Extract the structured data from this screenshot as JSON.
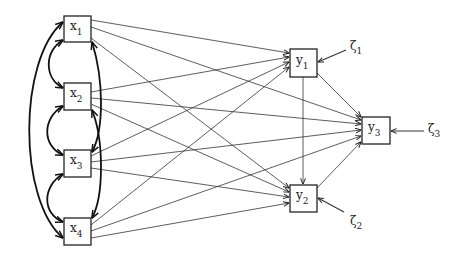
{
  "diagram": {
    "type": "path-diagram",
    "nodes": [
      {
        "id": "x1",
        "base": "x",
        "sub": "1",
        "role": "exogenous",
        "x": 64,
        "y": 16,
        "w": 27,
        "h": 26
      },
      {
        "id": "x2",
        "base": "x",
        "sub": "2",
        "role": "exogenous",
        "x": 64,
        "y": 83,
        "w": 27,
        "h": 27
      },
      {
        "id": "x3",
        "base": "x",
        "sub": "3",
        "role": "exogenous",
        "x": 64,
        "y": 150,
        "w": 27,
        "h": 27
      },
      {
        "id": "x4",
        "base": "x",
        "sub": "4",
        "role": "exogenous",
        "x": 64,
        "y": 218,
        "w": 27,
        "h": 27
      },
      {
        "id": "y1",
        "base": "y",
        "sub": "1",
        "role": "endogenous",
        "x": 290,
        "y": 49,
        "w": 27,
        "h": 28
      },
      {
        "id": "y2",
        "base": "y",
        "sub": "2",
        "role": "endogenous",
        "x": 290,
        "y": 185,
        "w": 27,
        "h": 27
      },
      {
        "id": "y3",
        "base": "y",
        "sub": "3",
        "role": "endogenous",
        "x": 362,
        "y": 117,
        "w": 28,
        "h": 27
      }
    ],
    "disturbances": [
      {
        "id": "zeta1",
        "base": "ζ",
        "sub": "1",
        "target": "y1"
      },
      {
        "id": "zeta2",
        "base": "ζ",
        "sub": "2",
        "target": "y2"
      },
      {
        "id": "zeta3",
        "base": "ζ",
        "sub": "3",
        "target": "y3"
      }
    ],
    "paths": [
      {
        "from": "x1",
        "to": "y1"
      },
      {
        "from": "x1",
        "to": "y3"
      },
      {
        "from": "x1",
        "to": "y2"
      },
      {
        "from": "x2",
        "to": "y1"
      },
      {
        "from": "x2",
        "to": "y3"
      },
      {
        "from": "x2",
        "to": "y2"
      },
      {
        "from": "x3",
        "to": "y1"
      },
      {
        "from": "x3",
        "to": "y3"
      },
      {
        "from": "x3",
        "to": "y2"
      },
      {
        "from": "x4",
        "to": "y1"
      },
      {
        "from": "x4",
        "to": "y3"
      },
      {
        "from": "x4",
        "to": "y2"
      },
      {
        "from": "y1",
        "to": "y2"
      },
      {
        "from": "y1",
        "to": "y3"
      },
      {
        "from": "y2",
        "to": "y3"
      }
    ],
    "covariances": [
      {
        "a": "x1",
        "b": "x2",
        "side": "left"
      },
      {
        "a": "x2",
        "b": "x3",
        "side": "left"
      },
      {
        "a": "x3",
        "b": "x4",
        "side": "left"
      },
      {
        "a": "x1",
        "b": "x4",
        "side": "left"
      },
      {
        "a": "x1",
        "b": "x3",
        "side": "right"
      },
      {
        "a": "x2",
        "b": "x4",
        "side": "right"
      }
    ]
  }
}
